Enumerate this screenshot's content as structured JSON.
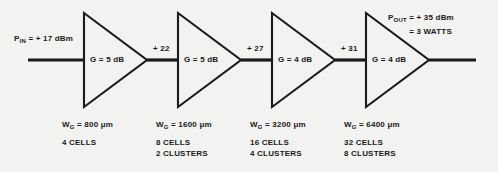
{
  "figure": {
    "type": "block-diagram",
    "background_color": "#f2f2f0",
    "line_color": "#1a1a1a"
  },
  "input_port": {
    "name": "P_IN",
    "symbol": "P",
    "subscript": "IN",
    "value": "= + 17 dBm"
  },
  "output_port": {
    "name": "P_OUT",
    "symbol": "P",
    "subscript": "OUT",
    "value": "= + 35 dBm",
    "value2": "= 3 WATTS"
  },
  "stages": [
    {
      "index": 1,
      "gain_label": "G = 5 dB",
      "gate_width_symbol": "W",
      "gate_width_subscript": "G",
      "gate_width_value": "= 800",
      "gate_width_unit": "μm",
      "cells": "4 CELLS",
      "clusters": ""
    },
    {
      "index": 2,
      "gain_label": "G = 5 dB",
      "gate_width_symbol": "W",
      "gate_width_subscript": "G",
      "gate_width_value": "= 1600",
      "gate_width_unit": "μm",
      "cells": "8 CELLS",
      "clusters": "2 CLUSTERS"
    },
    {
      "index": 3,
      "gain_label": "G = 4 dB",
      "gate_width_symbol": "W",
      "gate_width_subscript": "G",
      "gate_width_value": "= 3200",
      "gate_width_unit": "μm",
      "cells": "16 CELLS",
      "clusters": "4 CLUSTERS"
    },
    {
      "index": 4,
      "gain_label": "G = 4 dB",
      "gate_width_symbol": "W",
      "gate_width_subscript": "G",
      "gate_width_value": "= 6400",
      "gate_width_unit": "μm",
      "cells": "32 CELLS",
      "clusters": "8 CLUSTERS"
    }
  ],
  "interstage_levels": [
    {
      "label": "+ 22"
    },
    {
      "label": "+ 27"
    },
    {
      "label": "+ 31"
    }
  ]
}
